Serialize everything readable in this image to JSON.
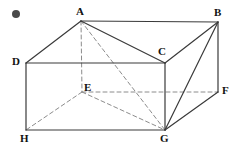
{
  "figure": {
    "name": "rectangular-prism-with-diagonals",
    "canvas": {
      "width": 238,
      "height": 148
    },
    "background_color": "#ffffff",
    "solid_line_color": "#3a3a3a",
    "dashed_line_color": "#8c8c8c",
    "label_color": "#111111",
    "bullet": {
      "name": "bullet-marker",
      "cx": 16,
      "cy": 14,
      "r": 4,
      "color": "#4a4a4a"
    },
    "vertices": [
      {
        "id": "A",
        "label": "A",
        "x": 81,
        "y": 21,
        "label_x": 76,
        "label_y": 6
      },
      {
        "id": "B",
        "label": "B",
        "x": 218,
        "y": 22,
        "label_x": 214,
        "label_y": 7
      },
      {
        "id": "C",
        "label": "C",
        "x": 165,
        "y": 63,
        "label_x": 158,
        "label_y": 46
      },
      {
        "id": "D",
        "label": "D",
        "x": 26,
        "y": 63,
        "label_x": 12,
        "label_y": 56
      },
      {
        "id": "E",
        "label": "E",
        "x": 82,
        "y": 92,
        "label_x": 84,
        "label_y": 82
      },
      {
        "id": "F",
        "label": "F",
        "x": 218,
        "y": 92,
        "label_x": 222,
        "label_y": 85
      },
      {
        "id": "G",
        "label": "G",
        "x": 165,
        "y": 130,
        "label_x": 160,
        "label_y": 133
      },
      {
        "id": "H",
        "label": "H",
        "x": 26,
        "y": 130,
        "label_x": 20,
        "label_y": 133
      }
    ],
    "solid_edges": [
      {
        "name": "edge-A-B",
        "from": "A",
        "to": "B"
      },
      {
        "name": "edge-A-D",
        "from": "A",
        "to": "D"
      },
      {
        "name": "edge-A-C",
        "from": "A",
        "to": "C"
      },
      {
        "name": "edge-B-C",
        "from": "B",
        "to": "C"
      },
      {
        "name": "edge-B-F",
        "from": "B",
        "to": "F"
      },
      {
        "name": "edge-B-G",
        "from": "B",
        "to": "G"
      },
      {
        "name": "edge-D-C",
        "from": "D",
        "to": "C"
      },
      {
        "name": "edge-C-G",
        "from": "C",
        "to": "G"
      },
      {
        "name": "edge-D-H",
        "from": "D",
        "to": "H"
      },
      {
        "name": "edge-F-G",
        "from": "F",
        "to": "G"
      },
      {
        "name": "edge-H-G",
        "from": "H",
        "to": "G"
      }
    ],
    "dashed_edges": [
      {
        "name": "edge-A-E",
        "from": "A",
        "to": "E"
      },
      {
        "name": "edge-A-G",
        "from": "A",
        "to": "G"
      },
      {
        "name": "edge-E-F",
        "from": "E",
        "to": "F"
      },
      {
        "name": "edge-E-H",
        "from": "E",
        "to": "H"
      },
      {
        "name": "edge-E-G",
        "from": "E",
        "to": "G"
      }
    ]
  }
}
